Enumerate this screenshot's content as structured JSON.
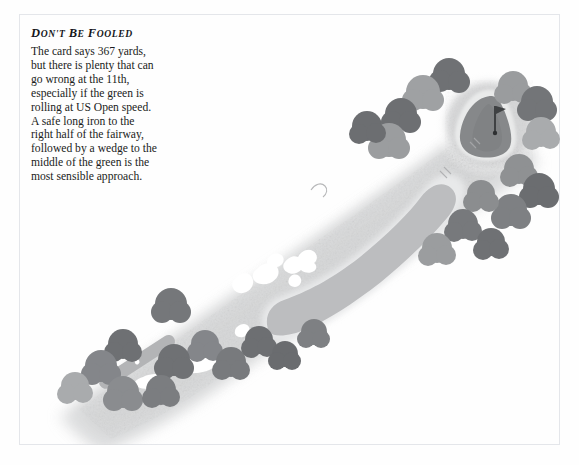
{
  "page": {
    "background_color": "#fefefe",
    "frame_color": "#e4e6ea"
  },
  "tip": {
    "heading": "Don't be Fooled",
    "body_lines": [
      "The card says 367 yards,",
      "but there is plenty that can",
      "go wrong at the 11th,",
      "especially if the green is",
      "rolling at US Open speed.",
      "A safe long iron to the",
      "right half of the fairway,",
      "followed by a wedge to the",
      "middle of the green is the",
      "most sensible approach."
    ],
    "body_text": "The card says 367 yards, but there is plenty that can go wrong at the 11th, especially if the green is rolling at US Open speed. A safe long iron to the right half of the fairway, followed by a wedge to the middle of the green is the most sensible approach.",
    "hole_number": "11th",
    "yardage": "367 yards"
  },
  "diagram": {
    "type": "golf-hole-plan",
    "palette": {
      "rough": "#c9cacb",
      "rough_light": "#d7d8d9",
      "fairway": "#b9babc",
      "green": "#8a8c8e",
      "bunker": "#ffffff",
      "tee": "#b1b2b4",
      "tree_dark": "#7b7d80",
      "tree_mid": "#9b9d9f",
      "tree_light": "#b6b8ba",
      "halo": "#ededee",
      "flag": "#4a4c4e"
    },
    "features": [
      {
        "name": "tee-box",
        "label": "Tee box",
        "x": 120,
        "y": 348
      },
      {
        "name": "fairway",
        "label": "Fairway",
        "x": 300,
        "y": 250
      },
      {
        "name": "green",
        "label": "Green",
        "x": 470,
        "y": 110
      },
      {
        "name": "flag-pin",
        "label": "Flag pin",
        "x": 476,
        "y": 105
      },
      {
        "name": "greenside-bunker",
        "label": "Greenside bunker",
        "x": 458,
        "y": 104
      },
      {
        "name": "fairway-bunkers",
        "label": "Fairway bunkers",
        "x": 245,
        "y": 258
      },
      {
        "name": "cross-bunker",
        "label": "Cross bunker",
        "x": 238,
        "y": 327
      },
      {
        "name": "tee-bunker",
        "label": "Tee-side bunker",
        "x": 200,
        "y": 360
      },
      {
        "name": "tree-line",
        "label": "Tree line",
        "x": 300,
        "y": 200
      }
    ]
  }
}
